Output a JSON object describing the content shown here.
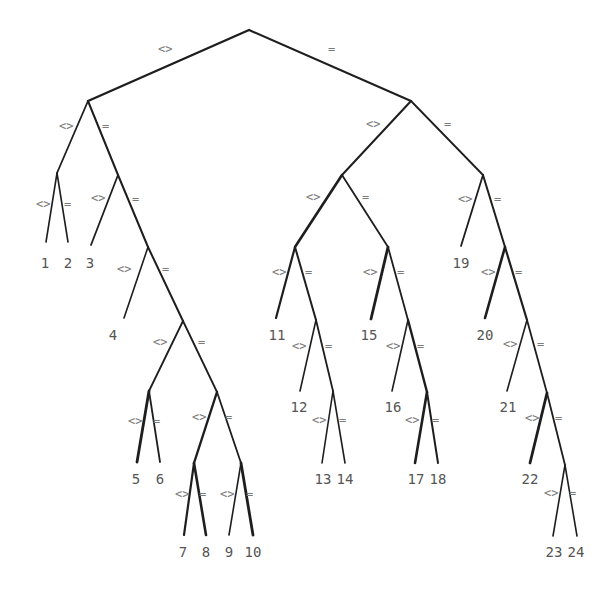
{
  "diagram": {
    "type": "binary-decision-tree",
    "edge_color": "#1e1e1e",
    "label_color": "#7a7a7a",
    "leaf_color": "#555555",
    "branch_labels": {
      "left": "<>",
      "right": "="
    },
    "nodes": [
      {
        "id": "n0",
        "x": 249,
        "y": 30
      },
      {
        "id": "n1",
        "x": 88,
        "y": 101
      },
      {
        "id": "n2",
        "x": 411,
        "y": 101
      },
      {
        "id": "n3",
        "x": 57,
        "y": 173
      },
      {
        "id": "n4",
        "x": 118,
        "y": 175
      },
      {
        "id": "n5",
        "x": 148,
        "y": 247
      },
      {
        "id": "n6",
        "x": 183,
        "y": 321
      },
      {
        "id": "n7",
        "x": 149,
        "y": 391
      },
      {
        "id": "n8",
        "x": 217,
        "y": 392
      },
      {
        "id": "n9",
        "x": 194,
        "y": 463
      },
      {
        "id": "n10",
        "x": 241,
        "y": 463
      },
      {
        "id": "n11",
        "x": 342,
        "y": 175
      },
      {
        "id": "n12",
        "x": 295,
        "y": 247
      },
      {
        "id": "n13",
        "x": 316,
        "y": 320
      },
      {
        "id": "n14",
        "x": 333,
        "y": 391
      },
      {
        "id": "n15",
        "x": 388,
        "y": 247
      },
      {
        "id": "n16",
        "x": 408,
        "y": 320
      },
      {
        "id": "n17",
        "x": 427,
        "y": 392
      },
      {
        "id": "n18",
        "x": 483,
        "y": 175
      },
      {
        "id": "n19",
        "x": 505,
        "y": 247
      },
      {
        "id": "n20",
        "x": 527,
        "y": 320
      },
      {
        "id": "n21",
        "x": 547,
        "y": 393
      },
      {
        "id": "n22",
        "x": 565,
        "y": 465
      }
    ],
    "leaves": [
      {
        "label": "1",
        "x": 46,
        "y": 242,
        "tx": 45,
        "ty": 268
      },
      {
        "label": "2",
        "x": 68,
        "y": 242,
        "tx": 68,
        "ty": 268
      },
      {
        "label": "3",
        "x": 91,
        "y": 245,
        "tx": 90,
        "ty": 268
      },
      {
        "label": "4",
        "x": 124,
        "y": 318,
        "tx": 113,
        "ty": 340
      },
      {
        "label": "5",
        "x": 137,
        "y": 462,
        "tx": 136,
        "ty": 484
      },
      {
        "label": "6",
        "x": 160,
        "y": 462,
        "tx": 160,
        "ty": 484
      },
      {
        "label": "7",
        "x": 184,
        "y": 535,
        "tx": 183,
        "ty": 557
      },
      {
        "label": "8",
        "x": 206,
        "y": 535,
        "tx": 206,
        "ty": 557
      },
      {
        "label": "9",
        "x": 229,
        "y": 535,
        "tx": 229,
        "ty": 557
      },
      {
        "label": "10",
        "x": 253,
        "y": 535,
        "tx": 253,
        "ty": 557
      },
      {
        "label": "11",
        "x": 276,
        "y": 318,
        "tx": 277,
        "ty": 340
      },
      {
        "label": "12",
        "x": 300,
        "y": 391,
        "tx": 299,
        "ty": 412
      },
      {
        "label": "13",
        "x": 322,
        "y": 463,
        "tx": 323,
        "ty": 484
      },
      {
        "label": "14",
        "x": 345,
        "y": 463,
        "tx": 345,
        "ty": 484
      },
      {
        "label": "15",
        "x": 371,
        "y": 319,
        "tx": 369,
        "ty": 340
      },
      {
        "label": "16",
        "x": 392,
        "y": 391,
        "tx": 393,
        "ty": 412
      },
      {
        "label": "17",
        "x": 415,
        "y": 463,
        "tx": 416,
        "ty": 484
      },
      {
        "label": "18",
        "x": 438,
        "y": 463,
        "tx": 438,
        "ty": 484
      },
      {
        "label": "19",
        "x": 461,
        "y": 246,
        "tx": 461,
        "ty": 268
      },
      {
        "label": "20",
        "x": 485,
        "y": 318,
        "tx": 485,
        "ty": 340
      },
      {
        "label": "21",
        "x": 507,
        "y": 391,
        "tx": 508,
        "ty": 412
      },
      {
        "label": "22",
        "x": 530,
        "y": 463,
        "tx": 530,
        "ty": 484
      },
      {
        "label": "23",
        "x": 553,
        "y": 536,
        "tx": 554,
        "ty": 557
      },
      {
        "label": "24",
        "x": 577,
        "y": 536,
        "tx": 576,
        "ty": 557
      }
    ],
    "edges": [
      {
        "from": "n0",
        "to": "n1",
        "w": 2.4,
        "label": "<>",
        "lx": 158,
        "ly": 53
      },
      {
        "from": "n0",
        "to": "n2",
        "w": 2.0,
        "label": "=",
        "lx": 328,
        "ly": 53
      },
      {
        "from": "n1",
        "to": "n3",
        "w": 1.8,
        "label": "<>",
        "lx": 59,
        "ly": 130
      },
      {
        "from": "n1",
        "to": "n4",
        "w": 2.0,
        "label": "=",
        "lx": 102,
        "ly": 130
      },
      {
        "from": "n3",
        "to": "L1",
        "w": 1.6,
        "label": "<>",
        "lx": 36,
        "ly": 208
      },
      {
        "from": "n3",
        "to": "L2",
        "w": 1.6,
        "label": "=",
        "lx": 64,
        "ly": 208
      },
      {
        "from": "n4",
        "to": "L3",
        "w": 1.8,
        "label": "<>",
        "lx": 91,
        "ly": 202
      },
      {
        "from": "n4",
        "to": "n5",
        "w": 2.0,
        "label": "=",
        "lx": 132,
        "ly": 203
      },
      {
        "from": "n5",
        "to": "L4",
        "w": 1.6,
        "label": "<>",
        "lx": 117,
        "ly": 273
      },
      {
        "from": "n5",
        "to": "n6",
        "w": 2.0,
        "label": "=",
        "lx": 162,
        "ly": 273
      },
      {
        "from": "n6",
        "to": "n7",
        "w": 1.8,
        "label": "<>",
        "lx": 153,
        "ly": 346
      },
      {
        "from": "n6",
        "to": "n8",
        "w": 1.8,
        "label": "=",
        "lx": 198,
        "ly": 346
      },
      {
        "from": "n7",
        "to": "L5",
        "w": 2.8,
        "label": "<>",
        "lx": 128,
        "ly": 425
      },
      {
        "from": "n7",
        "to": "L6",
        "w": 1.8,
        "label": "=",
        "lx": 153,
        "ly": 425
      },
      {
        "from": "n8",
        "to": "n9",
        "w": 2.4,
        "label": "<>",
        "lx": 192,
        "ly": 421
      },
      {
        "from": "n8",
        "to": "n10",
        "w": 1.8,
        "label": "=",
        "lx": 225,
        "ly": 421
      },
      {
        "from": "n9",
        "to": "L7",
        "w": 2.2,
        "label": "<>",
        "lx": 175,
        "ly": 498
      },
      {
        "from": "n9",
        "to": "L8",
        "w": 2.6,
        "label": "=",
        "lx": 199,
        "ly": 498
      },
      {
        "from": "n10",
        "to": "L9",
        "w": 1.6,
        "label": "<>",
        "lx": 220,
        "ly": 498
      },
      {
        "from": "n10",
        "to": "L10",
        "w": 2.8,
        "label": "=",
        "lx": 246,
        "ly": 498
      },
      {
        "from": "n2",
        "to": "n11",
        "w": 2.0,
        "label": "<>",
        "lx": 366,
        "ly": 128
      },
      {
        "from": "n2",
        "to": "n18",
        "w": 1.8,
        "label": "=",
        "lx": 444,
        "ly": 128
      },
      {
        "from": "n11",
        "to": "n12",
        "w": 2.6,
        "label": "<>",
        "lx": 306,
        "ly": 201
      },
      {
        "from": "n11",
        "to": "n15",
        "w": 1.8,
        "label": "=",
        "lx": 362,
        "ly": 201
      },
      {
        "from": "n12",
        "to": "L11",
        "w": 2.2,
        "label": "<>",
        "lx": 272,
        "ly": 276
      },
      {
        "from": "n12",
        "to": "n13",
        "w": 2.0,
        "label": "=",
        "lx": 305,
        "ly": 276
      },
      {
        "from": "n13",
        "to": "L12",
        "w": 1.6,
        "label": "<>",
        "lx": 292,
        "ly": 350
      },
      {
        "from": "n13",
        "to": "n14",
        "w": 1.8,
        "label": "=",
        "lx": 325,
        "ly": 350
      },
      {
        "from": "n14",
        "to": "L13",
        "w": 1.6,
        "label": "<>",
        "lx": 312,
        "ly": 424
      },
      {
        "from": "n14",
        "to": "L14",
        "w": 1.6,
        "label": "=",
        "lx": 339,
        "ly": 424
      },
      {
        "from": "n15",
        "to": "L15",
        "w": 2.8,
        "label": "<>",
        "lx": 363,
        "ly": 276
      },
      {
        "from": "n15",
        "to": "n16",
        "w": 1.8,
        "label": "=",
        "lx": 397,
        "ly": 276
      },
      {
        "from": "n16",
        "to": "L16",
        "w": 1.6,
        "label": "<>",
        "lx": 386,
        "ly": 350
      },
      {
        "from": "n16",
        "to": "n17",
        "w": 2.4,
        "label": "=",
        "lx": 417,
        "ly": 350
      },
      {
        "from": "n17",
        "to": "L17",
        "w": 2.6,
        "label": "<>",
        "lx": 405,
        "ly": 424
      },
      {
        "from": "n17",
        "to": "L18",
        "w": 2.0,
        "label": "=",
        "lx": 432,
        "ly": 424
      },
      {
        "from": "n18",
        "to": "L19",
        "w": 1.8,
        "label": "<>",
        "lx": 458,
        "ly": 203
      },
      {
        "from": "n18",
        "to": "n19",
        "w": 2.0,
        "label": "=",
        "lx": 494,
        "ly": 203
      },
      {
        "from": "n19",
        "to": "L20",
        "w": 2.6,
        "label": "<>",
        "lx": 481,
        "ly": 276
      },
      {
        "from": "n19",
        "to": "n20",
        "w": 2.2,
        "label": "=",
        "lx": 515,
        "ly": 276
      },
      {
        "from": "n20",
        "to": "L21",
        "w": 1.6,
        "label": "<>",
        "lx": 503,
        "ly": 348
      },
      {
        "from": "n20",
        "to": "n21",
        "w": 1.8,
        "label": "=",
        "lx": 537,
        "ly": 348
      },
      {
        "from": "n21",
        "to": "L22",
        "w": 2.8,
        "label": "<>",
        "lx": 525,
        "ly": 422
      },
      {
        "from": "n21",
        "to": "n22",
        "w": 1.8,
        "label": "=",
        "lx": 555,
        "ly": 422
      },
      {
        "from": "n22",
        "to": "L23",
        "w": 1.6,
        "label": "<>",
        "lx": 544,
        "ly": 497
      },
      {
        "from": "n22",
        "to": "L24",
        "w": 1.6,
        "label": "=",
        "lx": 569,
        "ly": 497
      }
    ]
  }
}
